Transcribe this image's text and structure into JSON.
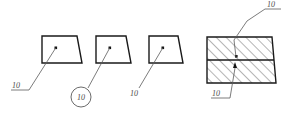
{
  "drawing": {
    "title": "Engineering section drawing with item balloons",
    "background_color": "#ffffff",
    "outline_color": "#1a1a1a",
    "leader_color": "#5a5a5a",
    "hatch_color": "#2b2b2b",
    "text_color": "#4a4a4a",
    "canvas": {
      "width": 283,
      "height": 120
    }
  },
  "parts": [
    {
      "id": "part-1",
      "shape": "trapezoid",
      "label": "10",
      "label_style": "underlined",
      "leader_from": "bottom-left"
    },
    {
      "id": "part-2",
      "shape": "trapezoid",
      "label": "10",
      "label_style": "balloon",
      "leader_from": "bottom-left"
    },
    {
      "id": "part-3",
      "shape": "trapezoid",
      "label": "10",
      "label_style": "plain",
      "leader_from": "bottom-left"
    }
  ],
  "section_block": {
    "id": "hatched-block",
    "description": "Two-layer hatched section block",
    "layers": [
      {
        "name": "upper-layer",
        "hatch": "diagonal-45"
      },
      {
        "name": "lower-layer",
        "hatch": "diagonal-45"
      }
    ],
    "callouts": [
      {
        "id": "callout-top",
        "label": "10",
        "label_style": "underlined",
        "position": "top-right"
      },
      {
        "id": "callout-bottom",
        "label": "10",
        "label_style": "underlined",
        "position": "bottom-left"
      }
    ]
  }
}
